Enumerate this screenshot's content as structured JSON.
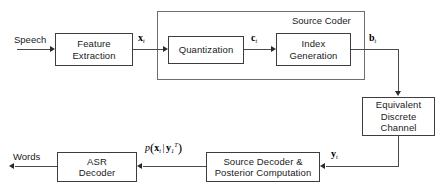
{
  "diagram": {
    "type": "block-diagram"
  },
  "blocks": [
    {
      "id": "feature_extraction",
      "label": "Feature\nExtraction"
    },
    {
      "id": "quantization",
      "label": "Quantization"
    },
    {
      "id": "index_generation",
      "label": "Index\nGeneration"
    },
    {
      "id": "equivalent_discrete_channel",
      "label": "Equivalent\nDiscrete\nChannel"
    },
    {
      "id": "source_decoder_posterior",
      "label": "Source Decoder &\nPosterior Computation"
    },
    {
      "id": "asr_decoder",
      "label": "ASR\nDecoder"
    }
  ],
  "groups": [
    {
      "id": "source_coder",
      "label": "Source Coder"
    }
  ],
  "io_labels": {
    "speech": "Speech",
    "words": "Words"
  },
  "signals": {
    "x_t": {
      "symbol": "x",
      "subscript": "t"
    },
    "c_t": {
      "symbol": "c",
      "subscript": "t"
    },
    "b_t": {
      "symbol": "b",
      "subscript": "t"
    },
    "y_t": {
      "symbol": "y",
      "subscript": "t"
    },
    "posterior": {
      "function": "p",
      "arg_symbol": "x",
      "arg_subscript": "t",
      "cond_symbol": "y",
      "cond_subscript": "1",
      "cond_superscript": "T"
    }
  },
  "colors": {
    "line": "#4a4a4a",
    "block_border": "#3d3d3d",
    "group_border": "#6e6e6e",
    "text": "#1a1a1a",
    "background": "#ffffff"
  }
}
